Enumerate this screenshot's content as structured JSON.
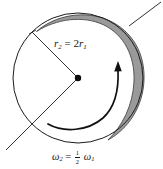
{
  "figure": {
    "background_color": "#ffffff",
    "stroke_color": "#1a1a1a",
    "band_fill_color": "#9a9a9a",
    "band_edge_color": "#4a4a4a"
  },
  "labels": {
    "radius_relation": {
      "full_text": "r2 = 2r1",
      "lhs_var": "r",
      "lhs_sub": "2",
      "equals": "=",
      "coefficient": "2",
      "rhs_var": "r",
      "rhs_sub": "1"
    },
    "angular_velocity_relation": {
      "full_text": "ω2 = 1/2 ω1",
      "lhs_var": "ω",
      "lhs_sub": "2",
      "equals": "=",
      "fraction_numerator": "1",
      "fraction_denominator": "2",
      "rhs_var": "ω",
      "rhs_sub": "1"
    }
  },
  "geometry": {
    "circle": {
      "cx": 78,
      "cy": 78,
      "r": 65
    },
    "center_dot": {
      "cx": 78,
      "cy": 78,
      "r": 3.2
    },
    "radius_line_upper": {
      "x1": 78,
      "y1": 78,
      "x2": 32,
      "y2": 32
    },
    "radius_line_lower": {
      "x1": 78,
      "y1": 78,
      "x2": 8,
      "y2": 148
    },
    "leader_line": {
      "x1": 130,
      "y1": 25,
      "x2": 161,
      "y2": 2
    }
  },
  "annotations": {
    "rotation_arrow_name": "rotation-direction-arrow",
    "shaded_band_name": "outer-rim-band",
    "leader_line_name": "rim-leader-line"
  }
}
